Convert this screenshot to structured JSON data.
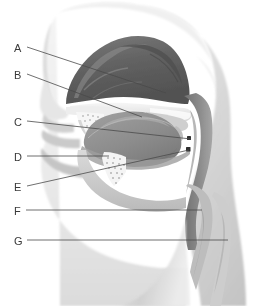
{
  "figure": {
    "width": 263,
    "height": 306,
    "background": "#ffffff",
    "style": "grayscale-airbrush-anatomical-illustration"
  },
  "palette": {
    "paper": "#ffffff",
    "skin_light": "#e3e3e3",
    "skin_mid": "#cfcfcf",
    "skin_shadow": "#b4b4b4",
    "mucosa_mid": "#8f8f8f",
    "mucosa_dark": "#6b6b6b",
    "concha_dark": "#5c5c5c",
    "tongue_gray": "#8a8a8a",
    "bone_light": "#f2f2f2",
    "cartilage": "#a8a8a8",
    "line": "#4a4a4a",
    "label_text": "#3a3a3a",
    "marker_dark": "#2e2e2e"
  },
  "labels": [
    {
      "id": "A",
      "text": "A",
      "x": 14,
      "y": 43,
      "leader": {
        "x1": 27,
        "y1": 47,
        "x2": 166,
        "y2": 93
      }
    },
    {
      "id": "B",
      "text": "B",
      "x": 14,
      "y": 70,
      "leader": {
        "x1": 27,
        "y1": 74,
        "x2": 142,
        "y2": 117
      }
    },
    {
      "id": "C",
      "text": "C",
      "x": 14,
      "y": 117,
      "leader": {
        "x1": 27,
        "y1": 121,
        "x2": 191,
        "y2": 139
      }
    },
    {
      "id": "D",
      "text": "D",
      "x": 14,
      "y": 152,
      "leader": {
        "x1": 27,
        "y1": 156,
        "x2": 109,
        "y2": 156
      }
    },
    {
      "id": "E",
      "text": "E",
      "x": 14,
      "y": 182,
      "leader": {
        "x1": 27,
        "y1": 186,
        "x2": 189,
        "y2": 150
      }
    },
    {
      "id": "F",
      "text": "F",
      "x": 14,
      "y": 206,
      "leader": {
        "x1": 26,
        "y1": 210,
        "x2": 202,
        "y2": 210
      }
    },
    {
      "id": "G",
      "text": "G",
      "x": 14,
      "y": 236,
      "leader": {
        "x1": 27,
        "y1": 240,
        "x2": 228,
        "y2": 240
      }
    }
  ],
  "leader_style": {
    "stroke": "#4a4a4a",
    "stroke_width": 0.8
  },
  "answer_blanks": []
}
